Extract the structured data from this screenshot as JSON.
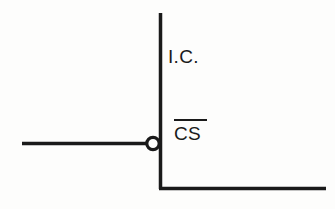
{
  "diagram": {
    "background_color": "#fdfdfc",
    "line_color": "#1a1a1a",
    "labels": {
      "ic": "I.C.",
      "cs": "CS",
      "cs_active_low": true
    },
    "elements": [
      {
        "name": "ic-boundary-vertical",
        "type": "line",
        "x1": 160.5,
        "y1": 13,
        "x2": 160.5,
        "y2": 189,
        "stroke_width": 3.5
      },
      {
        "name": "ic-boundary-bottom",
        "type": "line",
        "x1": 159,
        "y1": 188.5,
        "x2": 326,
        "y2": 188.5,
        "stroke_width": 3.5
      },
      {
        "name": "chip-select-signal-line",
        "type": "line",
        "x1": 22,
        "y1": 143.5,
        "x2": 147,
        "y2": 143.5,
        "stroke_width": 3.5
      },
      {
        "name": "inversion-bubble",
        "type": "circle",
        "cx": 153,
        "cy": 143.5,
        "r": 6.2,
        "fill": "#fdfdfc",
        "stroke_width": 3.2
      }
    ]
  }
}
